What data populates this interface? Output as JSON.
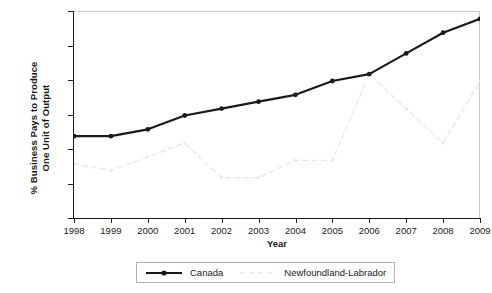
{
  "chart_data": {
    "type": "line",
    "title": "",
    "xlabel": "Year",
    "ylabel": "% Business Pays to Produce\nOne Unit of Output",
    "x": [
      1998,
      1999,
      2000,
      2001,
      2002,
      2003,
      2004,
      2005,
      2006,
      2007,
      2008,
      2009
    ],
    "categories": [
      "1998",
      "1999",
      "2000",
      "2001",
      "2002",
      "2003",
      "2004",
      "2005",
      "2006",
      "2007",
      "2008",
      "2009"
    ],
    "series": [
      {
        "name": "Canada",
        "color": "#1a1a1a",
        "style": "solid",
        "marker": "circle",
        "values": [
          0.52,
          0.52,
          0.53,
          0.55,
          0.56,
          0.57,
          0.58,
          0.6,
          0.61,
          0.64,
          0.67,
          0.69
        ]
      },
      {
        "name": "Newfoundland-Labrador",
        "color": "#e8e8e8",
        "style": "dashed",
        "marker": "circle",
        "values": [
          0.48,
          0.47,
          0.49,
          0.51,
          0.46,
          0.46,
          0.485,
          0.485,
          0.61,
          0.56,
          0.51,
          0.6
        ]
      }
    ],
    "ylim": [
      0.4,
      0.7
    ],
    "yticks": [
      0.7,
      0.65,
      0.6,
      0.55,
      0.5,
      0.45,
      0.4
    ],
    "ytick_labels": [
      ".7%",
      ".65",
      ".6",
      ".55",
      ".5",
      ".45",
      ".4"
    ],
    "xlim": [
      1998,
      2009
    ],
    "grid": false,
    "legend_position": "bottom"
  },
  "legend": {
    "entries": [
      {
        "label": "Canada",
        "icon": "solid-line-with-marker-icon"
      },
      {
        "label": "Newfoundland-Labrador",
        "icon": "dashed-line-icon"
      }
    ]
  }
}
